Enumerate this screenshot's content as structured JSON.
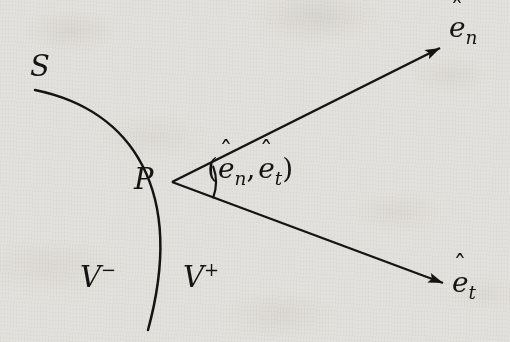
{
  "figure": {
    "type": "geometric-diagram",
    "background_color": "#f1f0ed",
    "ink_color": "#141414",
    "width": 510,
    "height": 342
  },
  "labels": {
    "surface": "S",
    "point": "P",
    "region_minus_base": "V",
    "region_minus_sup": "−",
    "region_plus_base": "V",
    "region_plus_sup": "+",
    "vector_normal_base": "e",
    "vector_normal_sub": "n",
    "vector_tangent_base": "e",
    "vector_tangent_sub": "t",
    "hat_accent": "ˆ",
    "angle_open_paren": "(",
    "angle_comma": ",",
    "angle_close_paren": ")"
  },
  "geometry": {
    "point_P": {
      "x": 172,
      "y": 182
    },
    "surface_curve": {
      "start": {
        "x": 35,
        "y": 90
      },
      "control_1": {
        "x": 132,
        "y": 110
      },
      "control_2": {
        "x": 186,
        "y": 190
      },
      "end": {
        "x": 148,
        "y": 330
      }
    },
    "vector_normal": {
      "from": {
        "x": 172,
        "y": 182
      },
      "to": {
        "x": 440,
        "y": 48
      },
      "arrowhead": "solid-triangle"
    },
    "vector_tangent": {
      "from": {
        "x": 172,
        "y": 182
      },
      "to": {
        "x": 443,
        "y": 283
      },
      "arrowhead": "solid-triangle"
    },
    "angle_arc": {
      "center": {
        "x": 172,
        "y": 182
      },
      "radius": 44,
      "start_angle_deg": -26.6,
      "end_angle_deg": 20.4
    },
    "line_width": 2.4
  }
}
